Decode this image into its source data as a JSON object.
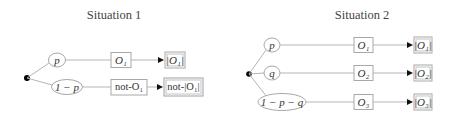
{
  "situations": [
    {
      "title": "Situation 1",
      "branches": [
        {
          "probability": "p",
          "event": "O₁",
          "outcome": "|O₁|"
        },
        {
          "probability": "1 − p",
          "event": "not-O₁",
          "outcome": "not-|O₁|"
        }
      ]
    },
    {
      "title": "Situation 2",
      "branches": [
        {
          "probability": "p",
          "event": "O₁",
          "outcome": "|O₁|"
        },
        {
          "probability": "q",
          "event": "O₂",
          "outcome": "|O₂|"
        },
        {
          "probability": "1 − p − q",
          "event": "O₃",
          "outcome": "|O₃|"
        }
      ]
    }
  ],
  "colors": {
    "line": "#b5b5b5",
    "node_border": "#a8a8a8",
    "root_dot": "#000000",
    "arrowhead": "#111111",
    "text": "#333333"
  }
}
